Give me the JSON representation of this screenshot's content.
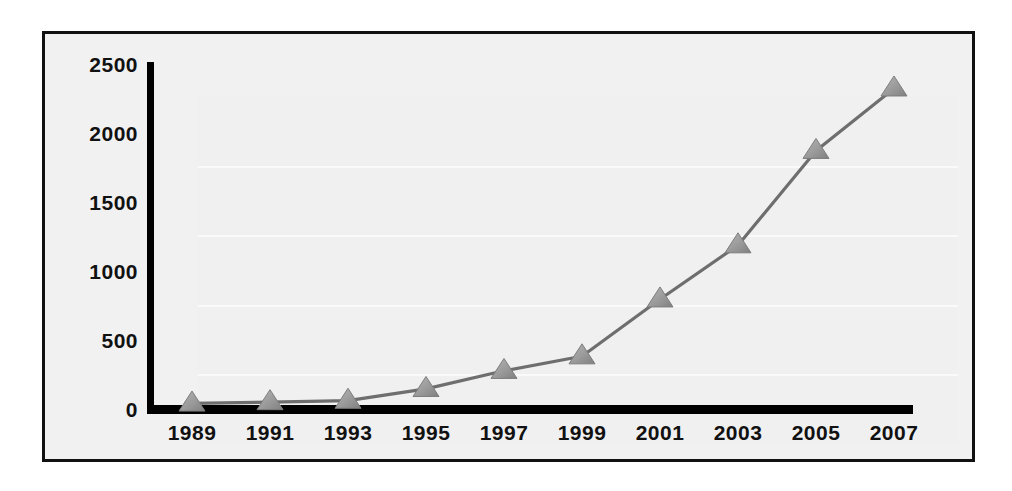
{
  "chart_data": {
    "type": "line",
    "title": "",
    "subtitle": "",
    "xlabel": "",
    "ylabel": "",
    "categories": [
      "1989",
      "1991",
      "1993",
      "1995",
      "1997",
      "1999",
      "2001",
      "2003",
      "2005",
      "2007"
    ],
    "x": [
      1989,
      1991,
      1993,
      1995,
      1997,
      1999,
      2001,
      2003,
      2005,
      2007
    ],
    "values": [
      40,
      50,
      60,
      145,
      275,
      380,
      790,
      1180,
      1860,
      2310
    ],
    "series": [
      {
        "name": "",
        "marker": "triangle-up",
        "marker_color": "#9a9a9a",
        "line_color": "#6e6e6e",
        "values": [
          40,
          50,
          60,
          145,
          275,
          380,
          790,
          1180,
          1860,
          2310
        ]
      }
    ],
    "xlim": [
      1988,
      2008
    ],
    "ylim": [
      0,
      2500
    ],
    "yticks": [
      0,
      500,
      1000,
      1500,
      2000,
      2500
    ],
    "ytick_labels": [
      "0",
      "500",
      "1000",
      "1500",
      "2000",
      "2500"
    ],
    "xticks": [
      1989,
      1991,
      1993,
      1995,
      1997,
      1999,
      2001,
      2003,
      2005,
      2007
    ],
    "xtick_labels": [
      "1989",
      "1991",
      "1993",
      "1995",
      "1997",
      "1999",
      "2001",
      "2003",
      "2005",
      "2007"
    ],
    "grid": true,
    "grid_axis": "y",
    "legend": false,
    "legend_position": "none",
    "annotations": []
  },
  "style": {
    "figure_background": "#ffffff",
    "plot_background": "#f0f0f0",
    "frame_color": "#111111",
    "axis_color": "#000000",
    "gridline_color": "#fafafa",
    "tick_label_color": "#111111",
    "line_color": "#6e6e6e",
    "marker_fill": "#9a9a9a",
    "marker_edge": "#7d7d7d"
  }
}
